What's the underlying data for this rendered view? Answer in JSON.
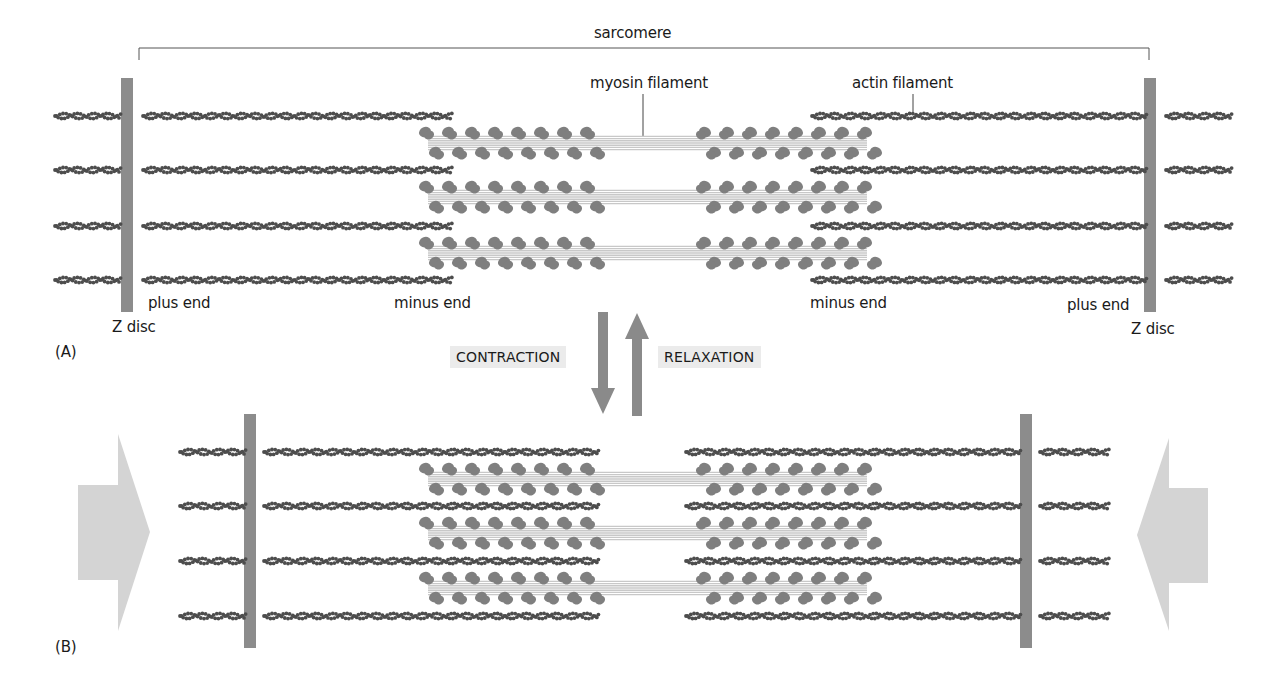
{
  "figure": {
    "panels": [
      {
        "id": "A",
        "label": "(A)",
        "state": "relaxed"
      },
      {
        "id": "B",
        "label": "(B)",
        "state": "contracted"
      }
    ],
    "labels": {
      "sarcomere": "sarcomere",
      "myosin_filament": "myosin filament",
      "actin_filament": "actin filament",
      "plus_end_left": "plus end",
      "plus_end_right": "plus end",
      "minus_end_left": "minus end",
      "minus_end_right": "minus end",
      "z_disc_left": "Z disc",
      "z_disc_right": "Z disc",
      "contraction": "CONTRACTION",
      "relaxation": "RELAXATION"
    },
    "colors": {
      "z_disc": "#8c8c8c",
      "actin": "#4d4d4d",
      "myosin_head": "#7f7f7f",
      "myosin_tail": "#c8c8c8",
      "state_arrow": "#8a8a8a",
      "force_arrow": "#d4d4d4",
      "bracket": "#555555",
      "label_bg": "#ebebeb"
    },
    "geometry": {
      "A": {
        "z_left_x": 127,
        "z_right_x": 1150,
        "z_top": 78,
        "z_bottom": 312,
        "actin_rows_y": [
          116,
          170,
          226,
          280
        ],
        "actin_left_segments": [
          [
            55,
            122
          ],
          [
            143,
            452
          ]
        ],
        "actin_right_segments": [
          [
            812,
            1146
          ],
          [
            1166,
            1232
          ]
        ],
        "myosin_rows_y": [
          143,
          197,
          253
        ]
      },
      "B": {
        "z_left_x": 250,
        "z_right_x": 1026,
        "z_top": 414,
        "z_bottom": 648,
        "actin_rows_y": [
          452,
          506,
          561,
          616
        ],
        "actin_left_segments": [
          [
            180,
            246
          ],
          [
            264,
            600
          ]
        ],
        "actin_right_segments": [
          [
            686,
            1022
          ],
          [
            1040,
            1108
          ]
        ],
        "myosin_rows_y": [
          479,
          533,
          588
        ]
      },
      "myosin": {
        "left_x": 410,
        "right_x": 885,
        "bare_left": 590,
        "bare_right": 695
      }
    }
  }
}
